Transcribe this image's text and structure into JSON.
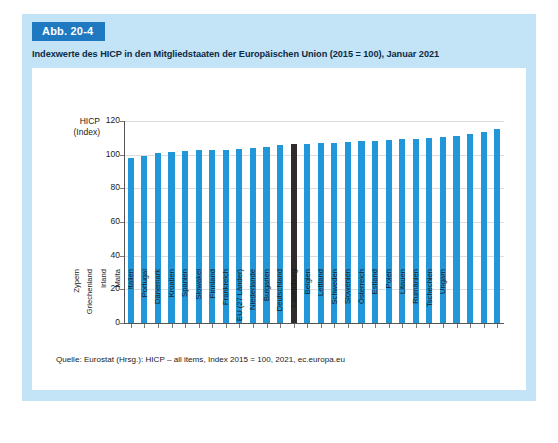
{
  "figure": {
    "badge": "Abb. 20-4",
    "title": "Indexwerte des HICP in den Mitgliedstaaten der Europäischen Union (2015 = 100), Januar 2021",
    "source": "Quelle: Eurostat (Hrsg.): HICP – all items, Index 2015 = 100, 2021, ec.europa.eu"
  },
  "colors": {
    "panel_background": "#c3e3f6",
    "badge_background": "#1e79c0",
    "bar": "#2196d8",
    "bar_highlight": "#2f2c2b",
    "gridline": "#dcdcdc",
    "axis": "#555555",
    "chart_background": "#ffffff"
  },
  "chart_data": {
    "type": "bar",
    "title": "Indexwerte des HICP in den Mitgliedstaaten der Europäischen Union (2015 = 100), Januar 2021",
    "xlabel": "",
    "ylabel": "HICP (Index)",
    "ylabel_lines": [
      "HICP",
      "(Index)"
    ],
    "ylim": [
      0,
      120
    ],
    "yticks": [
      0,
      20,
      40,
      60,
      80,
      100,
      120
    ],
    "ytick_labels": [
      "0",
      "20",
      "40",
      "60",
      "80",
      "100",
      "120"
    ],
    "grid": true,
    "legend": false,
    "highlight_category": "EU (27 Länder)",
    "categories": [
      "Zypern",
      "Griechenland",
      "Irland",
      "Malta",
      "Italien",
      "Portugal",
      "Dänemark",
      "Kroatien",
      "Spanien",
      "Slowakei",
      "Finnland",
      "Frankreich",
      "EU (27 Länder)",
      "Niederlande",
      "Bulgarien",
      "Deutschland",
      "Luxemburg",
      "Belgien",
      "Lettland",
      "Schweden",
      "Slowenien",
      "Österreich",
      "Estland",
      "Polen",
      "Litauen",
      "Rumänien",
      "Tschechien",
      "Ungarn"
    ],
    "values": [
      98.3,
      99.0,
      100.8,
      101.8,
      102.3,
      102.5,
      102.8,
      103.0,
      103.6,
      104.1,
      104.7,
      105.8,
      106.3,
      106.5,
      106.7,
      106.8,
      107.4,
      107.9,
      108.4,
      108.8,
      109.3,
      109.4,
      110.0,
      110.7,
      111.3,
      112.4,
      113.2,
      115.4
    ]
  }
}
